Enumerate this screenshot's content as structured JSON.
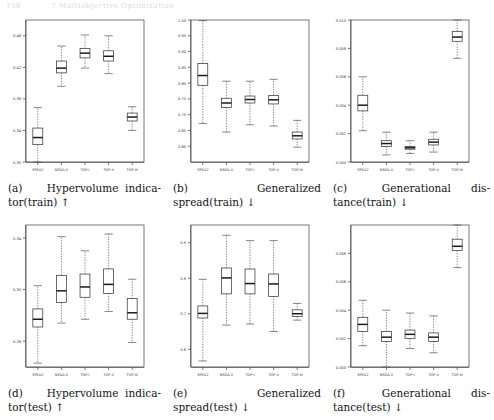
{
  "header": {
    "page_number": "158",
    "running_title": "7 Multiobjective Optimization"
  },
  "axis_categories": [
    "SPEA2",
    "NSGA-II",
    "TOP-I",
    "TOP-II",
    "TOP-III"
  ],
  "panels": [
    {
      "id": "a",
      "tag": "(a)",
      "caption_line1_left": "(a)",
      "caption_line1_right": "Hypervolume  indica-",
      "caption_line2": "tor(train) ↑",
      "caption_full": "(a) Hypervolume indicator(train) ↑"
    },
    {
      "id": "b",
      "tag": "(b)",
      "caption_line1_left": "(b)",
      "caption_line1_right": "Generalized",
      "caption_line2": "spread(train) ↓",
      "caption_full": "(b) Generalized spread(train) ↓"
    },
    {
      "id": "c",
      "tag": "(c)",
      "caption_line1_left": "(c)",
      "caption_line1_right": "Generational      dis-",
      "caption_line2": "tance(train) ↓",
      "caption_full": "(c) Generational distance(train) ↓"
    },
    {
      "id": "d",
      "tag": "(d)",
      "caption_line1_left": "(d)",
      "caption_line1_right": "Hypervolume  indica-",
      "caption_line2": "tor(test) ↑",
      "caption_full": "(d) Hypervolume indicator(test) ↑"
    },
    {
      "id": "e",
      "tag": "(e)",
      "caption_line1_left": "(e)",
      "caption_line1_right": "Generalized",
      "caption_line2": "spread(test) ↓",
      "caption_full": "(e) Generalized spread(test) ↓"
    },
    {
      "id": "f",
      "tag": "(f)",
      "caption_line1_left": "(f)",
      "caption_line1_right": "Generational      dis-",
      "caption_line2": "tance(test) ↓",
      "caption_full": "(f) Generational distance(test) ↓"
    }
  ],
  "chart_data": [
    {
      "type": "box",
      "panel": "a",
      "title": "Hypervolume indicator(train)",
      "direction": "higher-is-better",
      "xlabel": "",
      "ylabel": "",
      "categories": [
        "SPEA2",
        "NSGA-II",
        "TOP-I",
        "TOP-II",
        "TOP-III"
      ],
      "ylim": [
        0.3,
        0.48
      ],
      "yticks": [
        0.3,
        0.34,
        0.38,
        0.42,
        0.46
      ],
      "ytick_labels": [
        "0.30",
        "0.34",
        "0.38",
        "0.42",
        "0.46"
      ],
      "grid": false,
      "boxes": [
        {
          "category": "SPEA2",
          "lower_whisker": 0.3,
          "q1": 0.322,
          "median": 0.331,
          "q3": 0.343,
          "upper_whisker": 0.369
        },
        {
          "category": "NSGA-II",
          "lower_whisker": 0.396,
          "q1": 0.413,
          "median": 0.419,
          "q3": 0.428,
          "upper_whisker": 0.447
        },
        {
          "category": "TOP-I",
          "lower_whisker": 0.419,
          "q1": 0.432,
          "median": 0.438,
          "q3": 0.444,
          "upper_whisker": 0.461
        },
        {
          "category": "TOP-II",
          "lower_whisker": 0.412,
          "q1": 0.428,
          "median": 0.434,
          "q3": 0.441,
          "upper_whisker": 0.46
        },
        {
          "category": "TOP-III",
          "lower_whisker": 0.34,
          "q1": 0.352,
          "median": 0.357,
          "q3": 0.362,
          "upper_whisker": 0.37
        }
      ]
    },
    {
      "type": "box",
      "panel": "b",
      "title": "Generalized spread(train)",
      "direction": "lower-is-better",
      "xlabel": "",
      "ylabel": "",
      "categories": [
        "SPEA2",
        "NSGA-II",
        "TOP-I",
        "TOP-II",
        "TOP-III"
      ],
      "ylim": [
        0.55,
        1.0
      ],
      "yticks": [
        0.6,
        0.65,
        0.7,
        0.75,
        0.8,
        0.85,
        0.9,
        0.95,
        1.0
      ],
      "ytick_labels": [
        "0.60",
        "0.65",
        "0.70",
        "0.75",
        "0.80",
        "0.85",
        "0.90",
        "0.95",
        "1.00"
      ],
      "grid": false,
      "boxes": [
        {
          "category": "SPEA2",
          "lower_whisker": 0.672,
          "q1": 0.793,
          "median": 0.824,
          "q3": 0.862,
          "upper_whisker": 0.998
        },
        {
          "category": "NSGA-II",
          "lower_whisker": 0.645,
          "q1": 0.723,
          "median": 0.737,
          "q3": 0.752,
          "upper_whisker": 0.806
        },
        {
          "category": "TOP-I",
          "lower_whisker": 0.668,
          "q1": 0.737,
          "median": 0.748,
          "q3": 0.759,
          "upper_whisker": 0.806
        },
        {
          "category": "TOP-II",
          "lower_whisker": 0.664,
          "q1": 0.734,
          "median": 0.747,
          "q3": 0.761,
          "upper_whisker": 0.812
        },
        {
          "category": "TOP-III",
          "lower_whisker": 0.597,
          "q1": 0.623,
          "median": 0.633,
          "q3": 0.645,
          "upper_whisker": 0.682
        }
      ]
    },
    {
      "type": "box",
      "panel": "c",
      "title": "Generational distance(train)",
      "direction": "lower-is-better",
      "xlabel": "",
      "ylabel": "",
      "categories": [
        "SPEA2",
        "NSGA-II",
        "TOP-I",
        "TOP-II",
        "TOP-III"
      ],
      "ylim": [
        0.0,
        0.01
      ],
      "yticks": [
        0.0,
        0.002,
        0.004,
        0.006,
        0.008,
        0.01
      ],
      "ytick_labels": [
        "0.000",
        "0.002",
        "0.004",
        "0.006",
        "0.008",
        "0.010"
      ],
      "grid": false,
      "boxes": [
        {
          "category": "SPEA2",
          "lower_whisker": 0.0022,
          "q1": 0.0036,
          "median": 0.004,
          "q3": 0.0047,
          "upper_whisker": 0.006
        },
        {
          "category": "NSGA-II",
          "lower_whisker": 0.0005,
          "q1": 0.0011,
          "median": 0.0013,
          "q3": 0.0015,
          "upper_whisker": 0.0021
        },
        {
          "category": "TOP-I",
          "lower_whisker": 0.0006,
          "q1": 0.0009,
          "median": 0.001,
          "q3": 0.0011,
          "upper_whisker": 0.0015
        },
        {
          "category": "TOP-II",
          "lower_whisker": 0.0007,
          "q1": 0.0012,
          "median": 0.0014,
          "q3": 0.0016,
          "upper_whisker": 0.0021
        },
        {
          "category": "TOP-III",
          "lower_whisker": 0.0073,
          "q1": 0.0085,
          "median": 0.0088,
          "q3": 0.0092,
          "upper_whisker": 0.01
        }
      ]
    },
    {
      "type": "box",
      "panel": "d",
      "title": "Hypervolume indicator(test)",
      "direction": "higher-is-better",
      "xlabel": "",
      "ylabel": "",
      "categories": [
        "SPEA2",
        "NSGA-II",
        "TOP-I",
        "TOP-II",
        "TOP-III"
      ],
      "ylim": [
        0.24,
        0.35
      ],
      "yticks": [
        0.26,
        0.3,
        0.34
      ],
      "ytick_labels": [
        "0.26",
        "0.30",
        "0.34"
      ],
      "grid": false,
      "boxes": [
        {
          "category": "SPEA2",
          "lower_whisker": 0.243,
          "q1": 0.271,
          "median": 0.277,
          "q3": 0.285,
          "upper_whisker": 0.303
        },
        {
          "category": "NSGA-II",
          "lower_whisker": 0.274,
          "q1": 0.29,
          "median": 0.299,
          "q3": 0.311,
          "upper_whisker": 0.341
        },
        {
          "category": "TOP-I",
          "lower_whisker": 0.277,
          "q1": 0.294,
          "median": 0.302,
          "q3": 0.312,
          "upper_whisker": 0.33
        },
        {
          "category": "TOP-II",
          "lower_whisker": 0.283,
          "q1": 0.297,
          "median": 0.304,
          "q3": 0.316,
          "upper_whisker": 0.343
        },
        {
          "category": "TOP-III",
          "lower_whisker": 0.259,
          "q1": 0.277,
          "median": 0.282,
          "q3": 0.293,
          "upper_whisker": 0.308
        }
      ]
    },
    {
      "type": "box",
      "panel": "e",
      "title": "Generalized spread(test)",
      "direction": "lower-is-better",
      "xlabel": "",
      "ylabel": "",
      "categories": [
        "SPEA2",
        "NSGA-II",
        "TOP-I",
        "TOP-II",
        "TOP-III"
      ],
      "ylim": [
        0.55,
        0.95
      ],
      "yticks": [
        0.6,
        0.7,
        0.8,
        0.9
      ],
      "ytick_labels": [
        "0.6",
        "0.7",
        "0.8",
        "0.9"
      ],
      "grid": false,
      "boxes": [
        {
          "category": "SPEA2",
          "lower_whisker": 0.567,
          "q1": 0.688,
          "median": 0.701,
          "q3": 0.722,
          "upper_whisker": 0.797
        },
        {
          "category": "NSGA-II",
          "lower_whisker": 0.668,
          "q1": 0.756,
          "median": 0.801,
          "q3": 0.829,
          "upper_whisker": 0.921
        },
        {
          "category": "TOP-I",
          "lower_whisker": 0.671,
          "q1": 0.756,
          "median": 0.785,
          "q3": 0.826,
          "upper_whisker": 0.906
        },
        {
          "category": "TOP-II",
          "lower_whisker": 0.65,
          "q1": 0.749,
          "median": 0.784,
          "q3": 0.812,
          "upper_whisker": 0.906
        },
        {
          "category": "TOP-III",
          "lower_whisker": 0.682,
          "q1": 0.692,
          "median": 0.7,
          "q3": 0.711,
          "upper_whisker": 0.729
        }
      ]
    },
    {
      "type": "box",
      "panel": "f",
      "title": "Generational distance(test)",
      "direction": "lower-is-better",
      "xlabel": "",
      "ylabel": "",
      "categories": [
        "SPEA2",
        "NSGA-II",
        "TOP-I",
        "TOP-II",
        "TOP-III"
      ],
      "ylim": [
        0.0,
        0.01
      ],
      "yticks": [
        0.0,
        0.002,
        0.004,
        0.006,
        0.008
      ],
      "ytick_labels": [
        "0.000",
        "0.002",
        "0.004",
        "0.006",
        "0.008"
      ],
      "grid": false,
      "boxes": [
        {
          "category": "SPEA2",
          "lower_whisker": 0.0015,
          "q1": 0.0025,
          "median": 0.003,
          "q3": 0.0035,
          "upper_whisker": 0.0047
        },
        {
          "category": "NSGA-II",
          "lower_whisker": 0.0,
          "q1": 0.0018,
          "median": 0.0021,
          "q3": 0.0025,
          "upper_whisker": 0.004
        },
        {
          "category": "TOP-I",
          "lower_whisker": 0.0013,
          "q1": 0.002,
          "median": 0.0023,
          "q3": 0.0026,
          "upper_whisker": 0.0038
        },
        {
          "category": "TOP-II",
          "lower_whisker": 0.001,
          "q1": 0.0018,
          "median": 0.0021,
          "q3": 0.0024,
          "upper_whisker": 0.0036
        },
        {
          "category": "TOP-III",
          "lower_whisker": 0.007,
          "q1": 0.0082,
          "median": 0.0085,
          "q3": 0.009,
          "upper_whisker": 0.01
        }
      ]
    }
  ]
}
